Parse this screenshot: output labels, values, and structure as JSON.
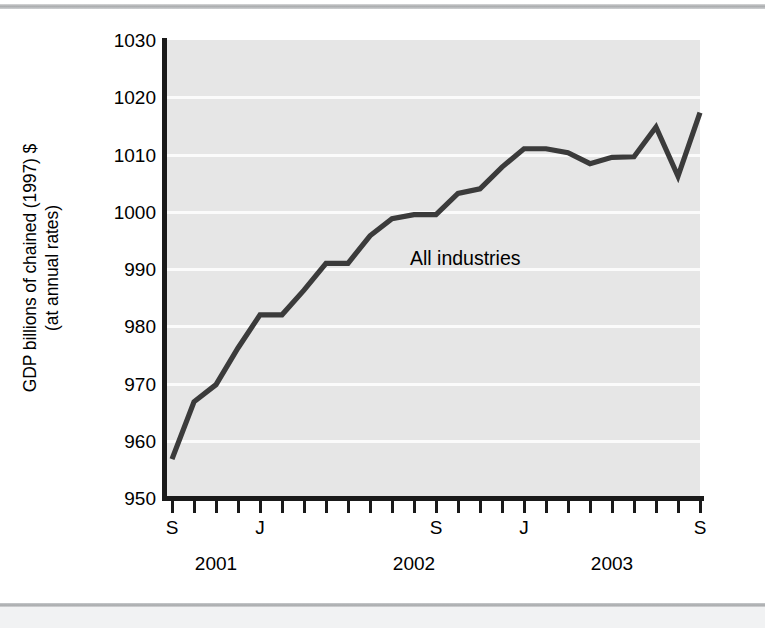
{
  "figure": {
    "y_axis_title": "GDP billions of chained (1997) $\n(at annual rates)",
    "annotation": "All industries",
    "annotation_x": 410,
    "annotation_y": 238
  },
  "chart_data": {
    "type": "line",
    "title": "",
    "xlabel": "",
    "ylabel": "GDP billions of chained (1997) $ (at annual rates)",
    "ylim": [
      950,
      1030
    ],
    "ytick_labels": [
      "1030",
      "1020",
      "1010",
      "1000",
      "990",
      "980",
      "970",
      "960",
      "950"
    ],
    "ytick_values": [
      1030,
      1020,
      1010,
      1000,
      990,
      980,
      970,
      960,
      950
    ],
    "grid": true,
    "grid_axis": "y",
    "legend": "none",
    "series_label": "All industries",
    "line_color": "#3b3b3b",
    "plot_bg": "#e6e6e6",
    "gridline_color": "#fbfbfb",
    "x_major_labels": [
      "S",
      "J",
      "S",
      "J",
      "S"
    ],
    "x_major_indices": [
      0,
      4,
      12,
      16,
      24
    ],
    "x_year_labels": [
      "2001",
      "2002",
      "2003"
    ],
    "x_year_indices": [
      2,
      11,
      20
    ],
    "x_tick_count": 25,
    "x": [
      "2001-09",
      "2001-10",
      "2001-11",
      "2001-12",
      "2002-01",
      "2002-02",
      "2002-03",
      "2002-04",
      "2002-05",
      "2002-06",
      "2002-07",
      "2002-08",
      "2002-09",
      "2002-10",
      "2002-11",
      "2002-12",
      "2003-01",
      "2003-02",
      "2003-03",
      "2003-04",
      "2003-05",
      "2003-06",
      "2003-07",
      "2003-08",
      "2003-09"
    ],
    "values": [
      956.8,
      966.8,
      969.8,
      976.2,
      982.0,
      982.0,
      986.3,
      991.0,
      991.0,
      995.8,
      998.8,
      999.5,
      999.5,
      1003.2,
      1004.0,
      1007.8,
      1011.0,
      1011.0,
      1010.3,
      1008.4,
      1009.5,
      1009.6,
      1014.8,
      1006.2,
      1017.3
    ]
  }
}
